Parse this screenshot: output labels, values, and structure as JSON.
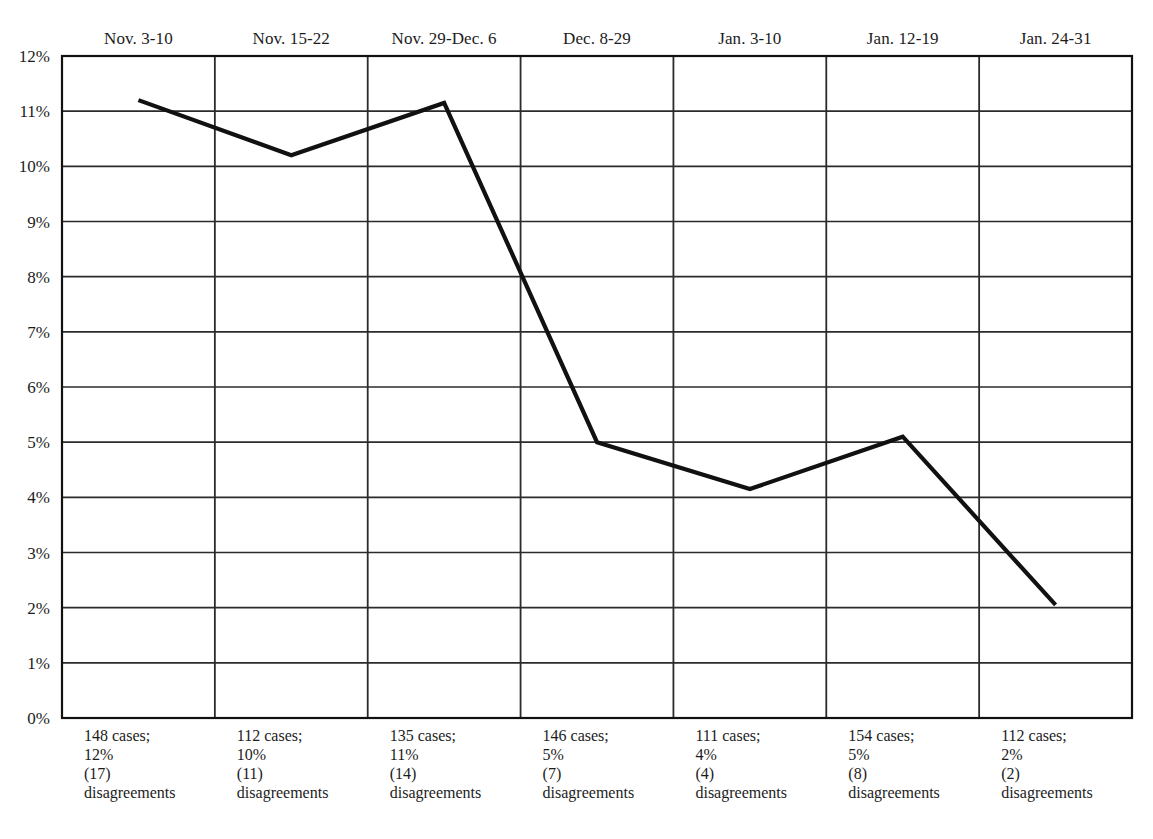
{
  "chart_data": {
    "type": "line",
    "title": "",
    "subtitle": "",
    "xlabel": "",
    "ylabel": "",
    "categories": [
      "Nov. 3-10",
      "Nov. 15-22",
      "Nov. 29-Dec. 6",
      "Dec. 8-29",
      "Jan. 3-10",
      "Jan. 12-19",
      "Jan. 24-31"
    ],
    "values": [
      11.2,
      10.2,
      11.15,
      5.0,
      4.15,
      5.1,
      2.05
    ],
    "series": [
      {
        "name": "Percent disagreements",
        "values": [
          11.2,
          10.2,
          11.15,
          5.0,
          4.15,
          5.1,
          2.05
        ]
      }
    ],
    "ylim": [
      0,
      12
    ],
    "ytick_step": 1,
    "ytick_labels": [
      "12%",
      "11%",
      "10%",
      "9%",
      "8%",
      "7%",
      "6%",
      "5%",
      "4%",
      "3%",
      "2%",
      "1%",
      "0%"
    ],
    "ytick_values": [
      12,
      11,
      10,
      9,
      8,
      7,
      6,
      5,
      4,
      3,
      2,
      1,
      0
    ],
    "grid": true,
    "grid_horizontal": true,
    "grid_vertical": true,
    "legend": false,
    "legend_position": "none",
    "line_color": "#111111",
    "grid_color": "#2b2b2b",
    "axis_color": "#111111",
    "background_color": "#ffffff",
    "annotations": [
      {
        "cases": "148 cases;",
        "percent": "12%",
        "count": "(17)",
        "label": "disagreements"
      },
      {
        "cases": "112 cases;",
        "percent": "10%",
        "count": "(11)",
        "label": "disagreements"
      },
      {
        "cases": "135 cases;",
        "percent": "11%",
        "count": "(14)",
        "label": "disagreements"
      },
      {
        "cases": "146 cases;",
        "percent": "5%",
        "count": "(7)",
        "label": "disagreements"
      },
      {
        "cases": "111 cases;",
        "percent": "4%",
        "count": "(4)",
        "label": "disagreements"
      },
      {
        "cases": "154 cases;",
        "percent": "5%",
        "count": "(8)",
        "label": "disagreements"
      },
      {
        "cases": "112 cases;",
        "percent": "2%",
        "count": "(2)",
        "label": "disagreements"
      }
    ]
  }
}
